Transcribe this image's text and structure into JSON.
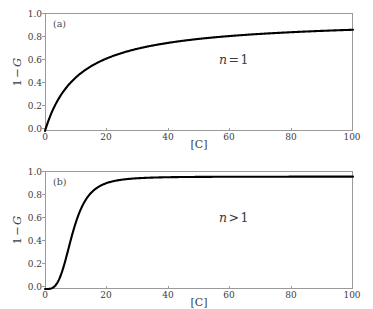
{
  "figure": {
    "background_color": "#ffffff",
    "frame_color": "#9a9a9a",
    "curve_color": "#000000",
    "text_color": "#3b3b3b"
  },
  "axes": {
    "xlabel": "[C]",
    "ylabel_full": "1 − G",
    "ylabel_parts": {
      "one": "1",
      "minus": "−",
      "g": "G"
    },
    "xticks": [
      "0",
      "20",
      "40",
      "60",
      "80",
      "100"
    ],
    "yticks": [
      "0.0",
      "0.2",
      "0.4",
      "0.6",
      "0.8",
      "1.0"
    ]
  },
  "panels": [
    {
      "tag": "(a)",
      "annotation_full": "n = 1",
      "annotation_parts": {
        "var": "n",
        "op": "=",
        "val": "1"
      }
    },
    {
      "tag": "(b)",
      "annotation_full": "n > 1",
      "annotation_parts": {
        "var": "n",
        "op": ">",
        "val": "1"
      }
    }
  ],
  "chart_data": [
    {
      "type": "line",
      "title": "(a)",
      "xlabel": "[C]",
      "ylabel": "1 - G",
      "xlim": [
        0,
        100
      ],
      "ylim": [
        0.0,
        1.05
      ],
      "xticks": [
        0,
        20,
        40,
        60,
        80,
        100
      ],
      "yticks": [
        0.0,
        0.2,
        0.4,
        0.6,
        0.8,
        1.0
      ],
      "grid": false,
      "legend": null,
      "annotations": [
        {
          "text": "n = 1",
          "x": 60,
          "y": 0.62
        }
      ],
      "series": [
        {
          "name": "n = 1",
          "model": "Hill: 1-G = C^n/(C^n + K^n), n = 1, K = 11",
          "color": "#000000",
          "x": [
            0,
            1,
            2,
            3,
            4,
            5,
            7,
            10,
            13,
            16,
            20,
            25,
            30,
            35,
            40,
            50,
            60,
            70,
            80,
            90,
            100
          ],
          "values": [
            0.0,
            0.083,
            0.154,
            0.214,
            0.267,
            0.313,
            0.389,
            0.476,
            0.542,
            0.593,
            0.645,
            0.694,
            0.732,
            0.761,
            0.784,
            0.82,
            0.845,
            0.864,
            0.879,
            0.891,
            0.901
          ]
        }
      ]
    },
    {
      "type": "line",
      "title": "(b)",
      "xlabel": "[C]",
      "ylabel": "1 - G",
      "xlim": [
        0,
        100
      ],
      "ylim": [
        0.0,
        1.05
      ],
      "xticks": [
        0,
        20,
        40,
        60,
        80,
        100
      ],
      "yticks": [
        0.0,
        0.2,
        0.4,
        0.6,
        0.8,
        1.0
      ],
      "grid": false,
      "legend": null,
      "annotations": [
        {
          "text": "n > 1",
          "x": 60,
          "y": 0.62
        }
      ],
      "series": [
        {
          "name": "n > 1",
          "model": "Hill: 1-G = C^n/(C^n + K^n), n = 3.5, K = 9",
          "color": "#000000",
          "x": [
            0,
            1,
            2,
            3,
            4,
            5,
            6,
            7,
            8,
            9,
            10,
            12,
            14,
            16,
            18,
            20,
            25,
            30,
            35,
            40,
            50,
            60,
            70,
            80,
            90,
            100
          ],
          "values": [
            0.0,
            0.004,
            0.012,
            0.031,
            0.063,
            0.111,
            0.176,
            0.256,
            0.376,
            0.5,
            0.589,
            0.745,
            0.845,
            0.903,
            0.937,
            0.957,
            0.982,
            0.991,
            0.995,
            0.997,
            0.998,
            0.999,
            0.999,
            1.0,
            1.0,
            1.0
          ]
        }
      ]
    }
  ]
}
